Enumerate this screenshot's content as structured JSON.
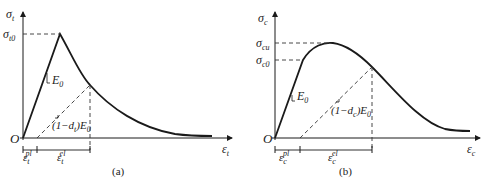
{
  "panels": [
    {
      "id": "a",
      "caption": "(a)",
      "y_axis_label": {
        "base": "σ",
        "sub": "t"
      },
      "x_axis_label": {
        "base": "ε",
        "sub": "t"
      },
      "origin_label": "O",
      "peak_label": {
        "base": "σ",
        "sub": "t0"
      },
      "slope_label": {
        "base": "E",
        "sub": "0"
      },
      "damaged_slope_label": {
        "pre": "(1−",
        "d": "d",
        "dsub": "t",
        "post": ")E",
        "sub": "0"
      },
      "plastic_strain_label": {
        "base": "ε",
        "sub": "t",
        "sup": "pl"
      },
      "elastic_strain_label": {
        "base": "ε",
        "sub": "t",
        "sup": "el"
      }
    },
    {
      "id": "b",
      "caption": "(b)",
      "y_axis_label": {
        "base": "σ",
        "sub": "c"
      },
      "x_axis_label": {
        "base": "ε",
        "sub": "c"
      },
      "origin_label": "O",
      "ultimate_label": {
        "base": "σ",
        "sub": "cu"
      },
      "yield_label": {
        "base": "σ",
        "sub": "c0"
      },
      "slope_label": {
        "base": "E",
        "sub": "0"
      },
      "damaged_slope_label": {
        "pre": "(1−",
        "d": "d",
        "dsub": "c",
        "post": ")E",
        "sub": "0"
      },
      "plastic_strain_label": {
        "base": "ε",
        "sub": "c",
        "sup": "pl"
      },
      "elastic_strain_label": {
        "base": "ε",
        "sub": "c",
        "sup": "el"
      }
    }
  ],
  "colors": {
    "line": "#1a1a1a",
    "dashed": "#333333",
    "background": "#ffffff"
  }
}
